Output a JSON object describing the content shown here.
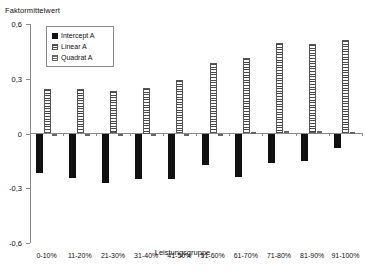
{
  "chart_data": {
    "type": "bar",
    "title": "",
    "ylabel": "Faktormittelwert",
    "xlabel": "Leistungsgruppe",
    "ylim": [
      -0.6,
      0.6
    ],
    "yticks": [
      0.6,
      0.3,
      0,
      -0.3,
      -0.6
    ],
    "ytick_labels": [
      "0,6",
      "0,3",
      "0",
      "-0,3",
      "-0,6"
    ],
    "grid": false,
    "legend_position": "upper-left-inside",
    "categories": [
      "0-10%",
      "11-20%",
      "21-30%",
      "31-40%",
      "41-50%",
      "51-60%",
      "61-70%",
      "71-80%",
      "81-90%",
      "91-100%"
    ],
    "series": [
      {
        "name": "Intercept A",
        "style": "solid-black",
        "values": [
          -0.215,
          -0.245,
          -0.27,
          -0.25,
          -0.25,
          -0.175,
          -0.24,
          -0.16,
          -0.15,
          -0.08
        ]
      },
      {
        "name": "Linear A",
        "style": "horizontal-hatch",
        "values": [
          0.245,
          0.245,
          0.235,
          0.25,
          0.295,
          0.385,
          0.415,
          0.495,
          0.49,
          0.51
        ]
      },
      {
        "name": "Quadrat A",
        "style": "horizontal-hatch-light",
        "values": [
          -0.005,
          -0.005,
          -0.005,
          -0.005,
          -0.005,
          -0.005,
          0.01,
          0.012,
          0.012,
          0.01
        ]
      }
    ]
  },
  "legend": {
    "items": [
      {
        "label": "Intercept A"
      },
      {
        "label": "Linear A"
      },
      {
        "label": "Quadrat A"
      }
    ]
  }
}
